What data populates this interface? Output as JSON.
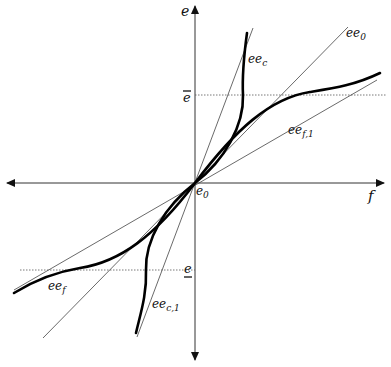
{
  "diagram": {
    "origin": {
      "x": 195,
      "y": 183
    },
    "axes": {
      "horizontal": {
        "label": "f",
        "x1": 6,
        "x2": 384,
        "y": 183
      },
      "vertical": {
        "label": "e",
        "x": 195,
        "y1": 6,
        "y2": 360
      }
    },
    "levels": {
      "upper": {
        "label": "ē",
        "y": 95
      },
      "lower": {
        "label": "e̲",
        "y": 270
      }
    },
    "lines": [
      {
        "name": "ee_0",
        "x1": 43,
        "y1": 338,
        "x2": 348,
        "y2": 27
      },
      {
        "name": "ee_c_tangent",
        "x1": 137,
        "y1": 337,
        "x2": 253,
        "y2": 28
      },
      {
        "name": "ee_f1",
        "x1": 14,
        "y1": 290,
        "x2": 377,
        "y2": 80
      }
    ],
    "labels": {
      "e_axis": "e",
      "f_axis": "f",
      "origin": {
        "base": "e",
        "sub": "0"
      },
      "ee0": {
        "base": "ee",
        "sub": "0"
      },
      "eec": {
        "base": "ee",
        "sub": "c"
      },
      "eef1": {
        "base": "ee",
        "sub": "f,1"
      },
      "eef": {
        "base": "ee",
        "sub": "f"
      },
      "eec1": {
        "base": "ee",
        "sub": "c,1"
      },
      "e_bar": "e",
      "e_under": "e"
    },
    "curves": [
      {
        "name": "ee_c",
        "description": "steep S-curve through origin, vertical near e-bar and e-underbar"
      },
      {
        "name": "ee_f",
        "description": "shallow S-curve through origin, flattening near e-bar and e-underbar"
      }
    ]
  }
}
